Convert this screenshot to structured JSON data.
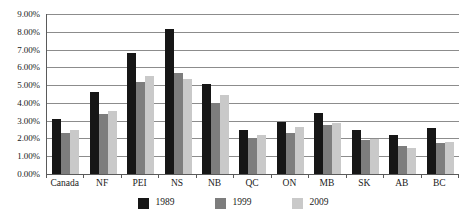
{
  "chart_data": {
    "type": "bar",
    "title": "",
    "xlabel": "",
    "ylabel": "",
    "ylim": [
      0,
      9
    ],
    "ytick_labels": [
      "0.00%",
      "1.00%",
      "2.00%",
      "3.00%",
      "4.00%",
      "5.00%",
      "6.00%",
      "7.00%",
      "8.00%",
      "9.00%"
    ],
    "ytick_values": [
      0,
      1,
      2,
      3,
      4,
      5,
      6,
      7,
      8,
      9
    ],
    "grid": true,
    "legend_position": "bottom",
    "categories": [
      "Canada",
      "NF",
      "PEI",
      "NS",
      "NB",
      "QC",
      "ON",
      "MB",
      "SK",
      "AB",
      "BC"
    ],
    "series": [
      {
        "name": "1989",
        "color": "#161616",
        "values": [
          3.1,
          4.6,
          6.8,
          8.15,
          5.05,
          2.5,
          2.95,
          3.45,
          2.45,
          2.2,
          2.6
        ]
      },
      {
        "name": "1999",
        "color": "#7d7d7d",
        "values": [
          2.3,
          3.4,
          5.2,
          5.7,
          4.0,
          2.0,
          2.3,
          2.75,
          1.9,
          1.55,
          1.75
        ]
      },
      {
        "name": "2009",
        "color": "#c9c9c9",
        "values": [
          2.45,
          3.55,
          5.5,
          5.35,
          4.45,
          2.2,
          2.65,
          2.85,
          1.95,
          1.45,
          1.8
        ]
      }
    ]
  }
}
